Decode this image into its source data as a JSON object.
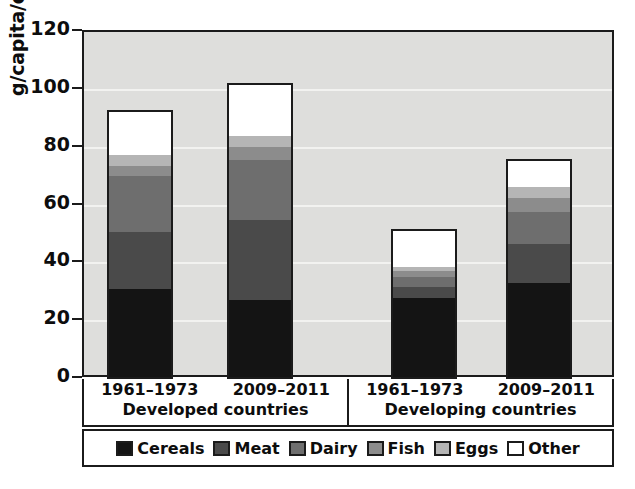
{
  "chart_data": {
    "type": "bar",
    "subtype": "stacked-bar",
    "title": "",
    "xlabel": "",
    "ylabel": "g/capita/day",
    "ylim": [
      0,
      120
    ],
    "yticks": [
      0,
      20,
      40,
      60,
      80,
      100,
      120
    ],
    "ytick_labels": [
      "0",
      "20",
      "40",
      "60",
      "80",
      "100",
      "120"
    ],
    "grid": true,
    "grid_axis": "y",
    "legend_position": "bottom",
    "groups": [
      {
        "name": "Developed countries",
        "categories": [
          "1961–1973",
          "2009–2011"
        ]
      },
      {
        "name": "Developing countries",
        "categories": [
          "1961–1973",
          "2009–2011"
        ]
      }
    ],
    "categories": [
      "Developed countries 1961–1973",
      "Developed countries 2009–2011",
      "Developing countries 1961–1973",
      "Developing countries 2009–2011"
    ],
    "series": [
      {
        "name": "Cereals",
        "color": "#141414",
        "values": [
          31,
          27,
          28,
          33
        ]
      },
      {
        "name": "Meat",
        "color": "#4a4a4a",
        "values": [
          20,
          28,
          4,
          14
        ]
      },
      {
        "name": "Dairy",
        "color": "#6e6e6e",
        "values": [
          19.5,
          21,
          3.5,
          11
        ]
      },
      {
        "name": "Fish",
        "color": "#8c8c8c",
        "values": [
          3.5,
          4.5,
          2,
          5
        ]
      },
      {
        "name": "Eggs",
        "color": "#b5b5b5",
        "values": [
          4,
          4,
          1.5,
          4
        ]
      },
      {
        "name": "Other",
        "color": "#ffffff",
        "values": [
          15,
          18,
          13,
          9
        ]
      }
    ],
    "totals": [
      93,
      102.5,
      51,
      76
    ],
    "units": "g/capita/day",
    "colors": {
      "plot_background": "#dededc",
      "gridline": "#f2f2f0",
      "axis": "#1b1b1b",
      "text": "#0d0d0d",
      "page_background": "#ffffff"
    }
  },
  "legend": {
    "items": [
      {
        "label": "Cereals",
        "color": "#141414"
      },
      {
        "label": "Meat",
        "color": "#4a4a4a"
      },
      {
        "label": "Dairy",
        "color": "#6e6e6e"
      },
      {
        "label": "Fish",
        "color": "#8c8c8c"
      },
      {
        "label": "Eggs",
        "color": "#b5b5b5"
      },
      {
        "label": "Other",
        "color": "#ffffff"
      }
    ]
  }
}
